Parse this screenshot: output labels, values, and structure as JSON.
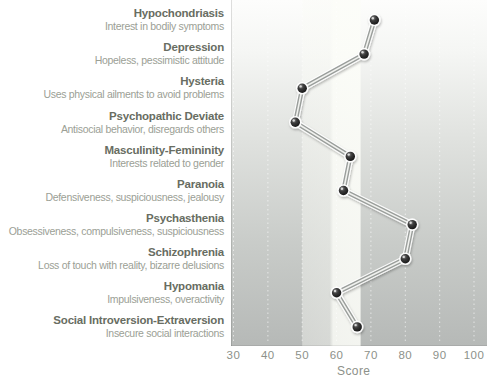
{
  "chart_data": {
    "type": "line",
    "orientation": "profile: category rows top-to-bottom, score on horizontal axis",
    "xlabel": "Score",
    "x_ticks": [
      30,
      40,
      50,
      60,
      70,
      80,
      90,
      100
    ],
    "x_range": [
      29,
      104
    ],
    "grid": "faint white dotted vertical line at each tick",
    "legend": "none",
    "highlight_band": {
      "from_score": 50,
      "to_score": 67
    },
    "rows": [
      {
        "name": "Hypochondriasis",
        "description": "Interest in bodily symptoms",
        "score": 71
      },
      {
        "name": "Depression",
        "description": "Hopeless, pessimistic attitude",
        "score": 68
      },
      {
        "name": "Hysteria",
        "description": "Uses physical ailments to avoid problems",
        "score": 50
      },
      {
        "name": "Psychopathic Deviate",
        "description": "Antisocial behavior, disregards others",
        "score": 48
      },
      {
        "name": "Masculinity-Femininity",
        "description": "Interests related to gender",
        "score": 64
      },
      {
        "name": "Paranoia",
        "description": "Defensiveness, suspiciousness, jealousy",
        "score": 62
      },
      {
        "name": "Psychasthenia",
        "description": "Obsessiveness, compulsiveness, suspiciousness",
        "score": 82
      },
      {
        "name": "Schizophrenia",
        "description": "Loss of touch with reality, bizarre delusions",
        "score": 80
      },
      {
        "name": "Hypomania",
        "description": "Impulsiveness, overactivity",
        "score": 60
      },
      {
        "name": "Social Introversion-Extraversion",
        "description": "Insecure social interactions",
        "score": 66
      }
    ],
    "colors": {
      "scale_name_text": "#686d62",
      "scale_description_text": "#9ba095",
      "axis_text": "#8d918a",
      "plot_gradient_top": "#fdfdfc",
      "plot_gradient_bottom": "#b6b9b7",
      "highlight_band": "#f6f7f2",
      "point_fill": "#0d0d0d",
      "rod_edge": "#9a9e9b",
      "rod_highlight": "#f1f2ef"
    }
  }
}
